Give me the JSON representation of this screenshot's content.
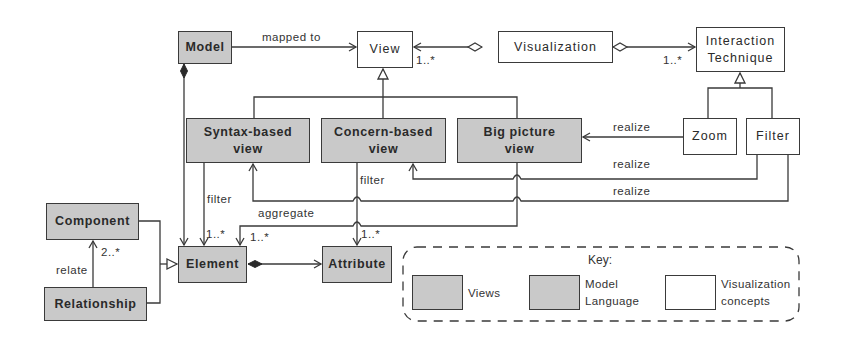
{
  "diagram": {
    "nodes": {
      "model": {
        "label": "Model",
        "category": "model-language"
      },
      "view": {
        "label": "View",
        "category": "visualization-concept"
      },
      "visualization": {
        "label": "Visualization",
        "category": "visualization-concept"
      },
      "interaction_technique": {
        "label_line1": "Interaction",
        "label_line2": "Technique",
        "category": "visualization-concept"
      },
      "syntax_view": {
        "label_line1": "Syntax-based",
        "label_line2": "view",
        "category": "view"
      },
      "concern_view": {
        "label_line1": "Concern-based",
        "label_line2": "view",
        "category": "view"
      },
      "big_picture_view": {
        "label_line1": "Big picture",
        "label_line2": "view",
        "category": "view"
      },
      "zoom": {
        "label": "Zoom",
        "category": "visualization-concept"
      },
      "filter": {
        "label": "Filter",
        "category": "visualization-concept"
      },
      "component": {
        "label": "Component",
        "category": "model-language"
      },
      "relationship": {
        "label": "Relationship",
        "category": "model-language"
      },
      "element": {
        "label": "Element",
        "category": "model-language"
      },
      "attribute": {
        "label": "Attribute",
        "category": "model-language"
      }
    },
    "edge_labels": {
      "mapped_to": "mapped to",
      "view_mult": "1..*",
      "interaction_mult": "1..*",
      "realize_zoom": "realize",
      "realize_filter_concern": "realize",
      "realize_filter_syntax": "realize",
      "filter_syntax": "filter",
      "filter_concern": "filter",
      "aggregate": "aggregate",
      "syntax_element_mult": "1..*",
      "aggregate_element_mult": "1..*",
      "attribute_mult": "1..*",
      "relate": "relate",
      "relate_mult": "2..*"
    },
    "edges": [
      {
        "from": "model",
        "to": "view",
        "type": "association",
        "label": "mapped to"
      },
      {
        "from": "visualization",
        "to": "view",
        "type": "aggregation",
        "mult": "1..*"
      },
      {
        "from": "visualization",
        "to": "interaction_technique",
        "type": "aggregation",
        "mult": "1..*"
      },
      {
        "from": "syntax_view",
        "to": "view",
        "type": "generalization"
      },
      {
        "from": "concern_view",
        "to": "view",
        "type": "generalization"
      },
      {
        "from": "big_picture_view",
        "to": "view",
        "type": "generalization"
      },
      {
        "from": "zoom",
        "to": "interaction_technique",
        "type": "generalization"
      },
      {
        "from": "filter",
        "to": "interaction_technique",
        "type": "generalization"
      },
      {
        "from": "zoom",
        "to": "big_picture_view",
        "type": "association",
        "label": "realize"
      },
      {
        "from": "filter",
        "to": "concern_view",
        "type": "association",
        "label": "realize"
      },
      {
        "from": "filter",
        "to": "syntax_view",
        "type": "association",
        "label": "realize"
      },
      {
        "from": "model",
        "to": "element",
        "type": "composition"
      },
      {
        "from": "syntax_view",
        "to": "element",
        "type": "association",
        "label": "filter",
        "mult": "1..*"
      },
      {
        "from": "big_picture_view",
        "to": "element",
        "type": "association",
        "label": "aggregate",
        "mult": "1..*"
      },
      {
        "from": "concern_view",
        "to": "attribute",
        "type": "association",
        "label": "filter",
        "mult": "1..*"
      },
      {
        "from": "element",
        "to": "attribute",
        "type": "composition"
      },
      {
        "from": "relationship",
        "to": "component",
        "type": "association",
        "label": "relate",
        "mult": "2..*"
      },
      {
        "from": "component",
        "to": "element",
        "type": "generalization"
      },
      {
        "from": "relationship",
        "to": "element",
        "type": "generalization"
      }
    ],
    "key": {
      "title": "Key:",
      "views": "Views",
      "model_language_line1": "Model",
      "model_language_line2": "Language",
      "vis_concepts_line1": "Visualization",
      "vis_concepts_line2": "concepts"
    },
    "colors": {
      "gray_fill": "#c9c9c9",
      "white_fill": "#ffffff",
      "stroke": "#3a3a3a"
    }
  }
}
